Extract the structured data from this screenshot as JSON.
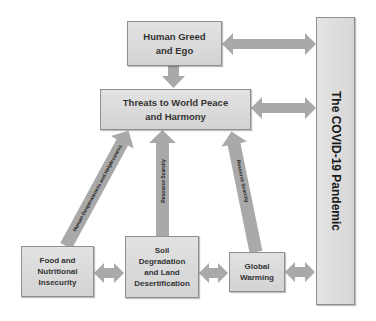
{
  "diagram": {
    "title": "",
    "colors": {
      "box_fill": "#d9d9d9",
      "box_border": "#8f8f8f",
      "arrow_fill": "#a9a9a9",
      "text": "#333333"
    },
    "nodes": {
      "human_greed": {
        "label": "Human Greed and Ego",
        "line1": "Human Greed",
        "line2": "and Ego"
      },
      "threats": {
        "label": "Threats to World Peace and Harmony",
        "line1": "Threats to World Peace",
        "line2": "and Harmony"
      },
      "covid": {
        "label": "The COVID-19 Pandemic"
      },
      "food": {
        "label": "Food and Nutritional Insecurity",
        "line1": "Food and",
        "line2": "Nutritional",
        "line3": "Insecurity"
      },
      "soil": {
        "label": "Soil Degradation and Land Desertification",
        "line1": "Soil",
        "line2": "Degradation",
        "line3": "and Land",
        "line4": "Desertification"
      },
      "global_warming": {
        "label": "Global Warming",
        "line1": "Global",
        "line2": "Warming"
      }
    },
    "edges": [
      {
        "from": "human_greed",
        "to": "threats",
        "type": "arrow",
        "label": ""
      },
      {
        "from": "human_greed",
        "to": "covid",
        "type": "double-arrow",
        "label": ""
      },
      {
        "from": "threats",
        "to": "covid",
        "type": "double-arrow",
        "label": ""
      },
      {
        "from": "food",
        "to": "threats",
        "type": "arrow",
        "label": "Human Desperateness and Helplessness"
      },
      {
        "from": "soil",
        "to": "threats",
        "type": "arrow",
        "label": "Resource Scarcity"
      },
      {
        "from": "global_warming",
        "to": "threats",
        "type": "arrow",
        "label": "Resource Scarcity"
      },
      {
        "from": "food",
        "to": "soil",
        "type": "double-arrow",
        "label": ""
      },
      {
        "from": "soil",
        "to": "global_warming",
        "type": "double-arrow",
        "label": ""
      },
      {
        "from": "global_warming",
        "to": "covid",
        "type": "double-arrow",
        "label": ""
      }
    ],
    "edge_labels": {
      "food_to_threats": "Human Desperateness and Helplessness",
      "soil_to_threats": "Resource Scarcity",
      "warming_to_threats": "Resource Scarcity"
    }
  }
}
